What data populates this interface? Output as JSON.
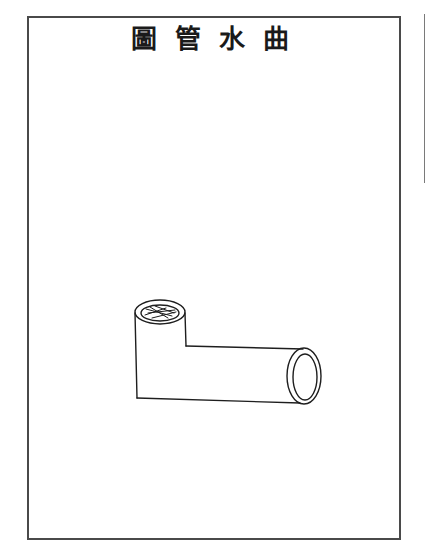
{
  "page": {
    "title": "圖管水曲",
    "title_reading_order": "right-to-left",
    "illustration": {
      "subject": "bent-water-pipe",
      "stroke_color": "#1e1e1e"
    },
    "colors": {
      "paper": "#ffffff",
      "border": "#4a4a4a",
      "ink": "#1a1a1a"
    }
  }
}
